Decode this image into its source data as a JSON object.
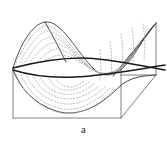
{
  "figure": {
    "caption": "a",
    "kind": "3d-saddle-surface-with-contours",
    "colors": {
      "background": "#ffffff",
      "frame_line": "#6f6f6f",
      "surface_outline": "#4a4a4a",
      "contour_dotted": "#a6a6a6",
      "bold_curve": "#1a1a1a",
      "caption_text": "#2a2a2a"
    },
    "geometry": {
      "box": {
        "front_bottom_left": [
          13,
          118
        ],
        "front_bottom_right": [
          121,
          118
        ],
        "front_top_left": [
          13,
          68
        ],
        "front_top_right": [
          121,
          68
        ],
        "back_bottom_right": [
          156,
          75
        ],
        "back_top_right": [
          156,
          23
        ],
        "depth_offset": [
          35,
          -43
        ]
      },
      "surface_outline_points": [
        [
          13,
          68
        ],
        [
          45,
          22
        ],
        [
          70,
          45
        ],
        [
          92,
          72
        ],
        [
          118,
          86
        ],
        [
          140,
          60
        ],
        [
          156,
          23
        ]
      ],
      "surface_bottom_points": [
        [
          13,
          68
        ],
        [
          28,
          90
        ],
        [
          50,
          108
        ],
        [
          75,
          113
        ],
        [
          100,
          104
        ],
        [
          121,
          84
        ],
        [
          156,
          75
        ]
      ],
      "bold_curves": [
        {
          "name": "upper-ridge-curve",
          "points": [
            [
              13,
              68
            ],
            [
              45,
              62
            ],
            [
              80,
              58
            ],
            [
              110,
              61
            ],
            [
              140,
              66
            ],
            [
              163,
              70
            ]
          ]
        },
        {
          "name": "lower-ridge-curve",
          "points": [
            [
              13,
              70
            ],
            [
              40,
              75
            ],
            [
              72,
              77
            ],
            [
              103,
              73
            ],
            [
              133,
              69
            ],
            [
              163,
              66
            ]
          ]
        }
      ],
      "contour_count_upper": 6,
      "contour_count_lower": 7,
      "contour_style": "dotted"
    }
  }
}
